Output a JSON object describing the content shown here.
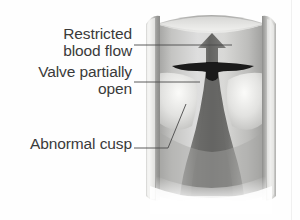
{
  "figure": {
    "style": "grayscale medical illustration",
    "background_color": "#fefefe",
    "text_color": "#3a3a3a",
    "leader_line_color": "#4a4a4a"
  },
  "labels": [
    {
      "id": "restricted-blood-flow",
      "line1": "Restricted",
      "line2": "blood flow",
      "text_align": "right",
      "leader_to": "arrow-shaft"
    },
    {
      "id": "valve-partially-open",
      "line1": "Valve partially",
      "line2": "open",
      "text_align": "right",
      "leader_to": "valve-cusp-left"
    },
    {
      "id": "abnormal-cusp",
      "line1": "Abnormal cusp",
      "line2": "",
      "text_align": "right",
      "leader_to": "cusp-base"
    }
  ],
  "artwork": {
    "vessel": {
      "name": "blood vessel cylinder",
      "left_wall_x": 146,
      "right_wall_x": 272,
      "top_y": 12,
      "bottom_y": 206,
      "wall_color_light": "#e8e8e6",
      "wall_color_mid": "#b8b8b6",
      "wall_color_dark": "#8d8d8b",
      "interior_color": "#cfcfcd"
    },
    "arrow": {
      "name": "blood flow arrow",
      "direction": "up",
      "color": "#6e6e6c",
      "tip_y": 34,
      "base_y": 72,
      "center_x": 212,
      "head_width": 26,
      "shaft_width": 11
    },
    "cusps": {
      "name": "valve cusps",
      "color": "#1c1c1c",
      "span_left_x": 172,
      "span_right_x": 254,
      "center_y": 68
    },
    "jet": {
      "name": "restricted blood jet",
      "color": "#7a7a78",
      "narrowest_width": 11,
      "top_y": 72,
      "bottom_y": 185
    }
  }
}
